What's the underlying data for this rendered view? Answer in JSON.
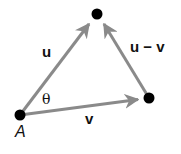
{
  "diagram": {
    "type": "vector-triangle",
    "colors": {
      "arrow": "#8a8a8a",
      "point": "#000000",
      "text": "#111111"
    },
    "points": {
      "A": {
        "x": 20,
        "y": 115,
        "label": "A"
      },
      "top": {
        "x": 97,
        "y": 14
      },
      "right": {
        "x": 149,
        "y": 98
      }
    },
    "vectors": [
      {
        "name": "u",
        "label": "u",
        "from": "A",
        "to": "top"
      },
      {
        "name": "v",
        "label": "v",
        "from": "A",
        "to": "right"
      },
      {
        "name": "u-minus-v",
        "label": "u − v",
        "from": "right",
        "to": "top"
      }
    ],
    "angle_label": "θ",
    "point_label_A": "A",
    "label_u": "u",
    "label_v": "v",
    "label_u_minus_v": "u − v"
  }
}
